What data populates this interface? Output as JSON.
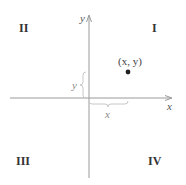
{
  "diagram": {
    "type": "cartesian-coordinate-plane",
    "axes": {
      "x_label": "x",
      "y_label": "y",
      "color": "#9a9a9a"
    },
    "quadrants": [
      {
        "id": "I",
        "label": "I"
      },
      {
        "id": "II",
        "label": "II"
      },
      {
        "id": "III",
        "label": "III"
      },
      {
        "id": "IV",
        "label": "IV"
      }
    ],
    "point": {
      "label": "(x, y)",
      "color": "#222222"
    },
    "braces": {
      "horizontal_label": "x",
      "vertical_label": "y",
      "color": "#c8c8c8"
    }
  }
}
